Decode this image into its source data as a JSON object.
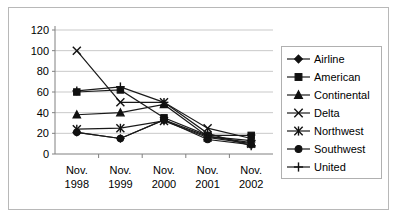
{
  "chart_data": {
    "type": "line",
    "title": "",
    "xlabel": "",
    "ylabel": "",
    "ylim": [
      0,
      120
    ],
    "ytick_labels": [
      "120",
      "100",
      "80",
      "60",
      "40",
      "20",
      "0"
    ],
    "ytick_values": [
      120,
      100,
      80,
      60,
      40,
      20,
      0
    ],
    "grid": true,
    "legend_position": "right",
    "categories": [
      "Nov. 1998",
      "Nov. 1999",
      "Nov. 2000",
      "Nov. 2001",
      "Nov. 2002"
    ],
    "category_lines": [
      [
        "Nov.",
        "1998"
      ],
      [
        "Nov.",
        "1999"
      ],
      [
        "Nov.",
        "2000"
      ],
      [
        "Nov.",
        "2001"
      ],
      [
        "Nov.",
        "2002"
      ]
    ],
    "series": [
      {
        "name": "Airline",
        "marker": "diamond",
        "values": [
          21,
          15,
          33,
          17,
          13
        ]
      },
      {
        "name": "American",
        "marker": "square",
        "values": [
          60,
          62,
          35,
          18,
          18
        ]
      },
      {
        "name": "Continental",
        "marker": "triangle",
        "values": [
          38,
          40,
          48,
          17,
          11
        ]
      },
      {
        "name": "Delta",
        "marker": "cross-x",
        "values": [
          100,
          50,
          50,
          25,
          15
        ]
      },
      {
        "name": "Northwest",
        "marker": "asterisk",
        "values": [
          24,
          25,
          32,
          16,
          10
        ]
      },
      {
        "name": "Southwest",
        "marker": "circle",
        "values": [
          21,
          15,
          33,
          14,
          9
        ]
      },
      {
        "name": "United",
        "marker": "plus",
        "values": [
          61,
          65,
          50,
          20,
          8
        ]
      }
    ]
  },
  "legend": {
    "entries": [
      {
        "label": "Airline",
        "marker": "diamond"
      },
      {
        "label": "American",
        "marker": "square"
      },
      {
        "label": "Continental",
        "marker": "triangle"
      },
      {
        "label": "Delta",
        "marker": "cross-x"
      },
      {
        "label": "Northwest",
        "marker": "asterisk"
      },
      {
        "label": "Southwest",
        "marker": "circle"
      },
      {
        "label": "United",
        "marker": "plus"
      }
    ]
  },
  "colors": {
    "series_stroke": "#1a1a1a",
    "gridline": "#c9c9c9",
    "axis": "#808080",
    "frame_border": "#b8b8b8",
    "legend_border": "#b0b0b0",
    "background": "#ffffff",
    "text": "#000000"
  }
}
